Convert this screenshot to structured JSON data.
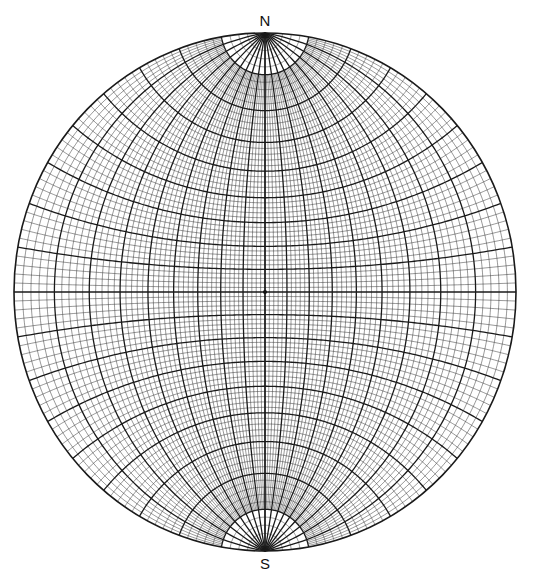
{
  "diagram": {
    "type": "stereonet-wulff-net",
    "labels": {
      "north": "N",
      "south": "S"
    },
    "grid": {
      "minor_interval_deg": 2,
      "major_interval_deg": 10
    },
    "colors": {
      "line": "#1a1a1a",
      "background": "#ffffff"
    }
  }
}
